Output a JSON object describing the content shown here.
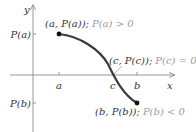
{
  "diagram": {
    "axes": {
      "x_label": "x",
      "y_label": "y"
    },
    "x_ticks": [
      {
        "label": "a"
      },
      {
        "label": "c"
      },
      {
        "label": "b"
      }
    ],
    "y_ticks": [
      {
        "label": "P(a)"
      },
      {
        "label": "P(b)"
      }
    ],
    "points": [
      {
        "coord": "(a, P(a));",
        "condition": "P(a) > 0"
      },
      {
        "coord": "(c, P(c));",
        "condition": "P(c) = 0"
      },
      {
        "coord": "(b, P(b));",
        "condition": "P(b) < 0"
      }
    ],
    "colors": {
      "curve": "#3a3a3a",
      "axis": "#8a8a8a",
      "text_dark": "#333333",
      "text_light": "#9a9a9a"
    }
  }
}
